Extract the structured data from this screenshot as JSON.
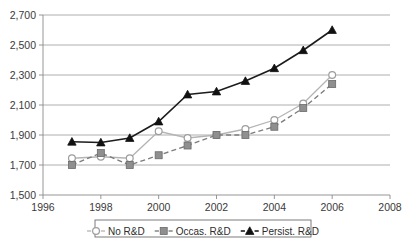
{
  "chart_data": {
    "type": "line",
    "title": "",
    "subtitle": "",
    "xlabel": "",
    "ylabel": "",
    "x": [
      1997,
      1998,
      1999,
      2000,
      2001,
      2002,
      2003,
      2004,
      2005,
      2006
    ],
    "xlim": [
      1996,
      2008
    ],
    "ylim": [
      1500,
      2700
    ],
    "x_ticks": [
      1996,
      1998,
      2000,
      2002,
      2004,
      2006,
      2008
    ],
    "x_tick_labels": [
      "1996",
      "1998",
      "2000",
      "2002",
      "2004",
      "2006",
      "2008"
    ],
    "y_ticks": [
      1500,
      1700,
      1900,
      2100,
      2300,
      2500,
      2700
    ],
    "y_tick_labels": [
      "1,500",
      "1,700",
      "1,900",
      "2,100",
      "2,300",
      "2,500",
      "2,700"
    ],
    "grid": true,
    "legend_position": "bottom",
    "series": [
      {
        "name": "No R&D",
        "marker": "open-circle",
        "color": "#b4b4b4",
        "line_style": "solid",
        "values": [
          1745,
          1755,
          1745,
          1925,
          1880,
          1900,
          1940,
          2000,
          2110,
          2300
        ]
      },
      {
        "name": "Occas. R&D",
        "marker": "filled-square",
        "color": "#8f8f8f",
        "line_style": "dashed",
        "values": [
          1700,
          1780,
          1700,
          1765,
          1830,
          1900,
          1900,
          1955,
          2080,
          2240
        ]
      },
      {
        "name": "Persist. R&D",
        "marker": "filled-triangle",
        "color": "#111111",
        "line_style": "solid",
        "values": [
          1855,
          1850,
          1880,
          1990,
          2170,
          2190,
          2260,
          2345,
          2465,
          2600
        ]
      }
    ]
  },
  "legend": {
    "items": [
      {
        "label": "No R&D",
        "marker": "open-circle"
      },
      {
        "label": "Occas. R&D",
        "marker": "filled-square"
      },
      {
        "label": "Persist. R&D",
        "marker": "filled-triangle"
      }
    ]
  },
  "colors": {
    "no_rd": "#b4b4b4",
    "occas_rd": "#8f8f8f",
    "persist_rd": "#111111",
    "grid": "#9a9a9a",
    "axis": "#8a8a8a",
    "text": "#3a3a3a"
  }
}
